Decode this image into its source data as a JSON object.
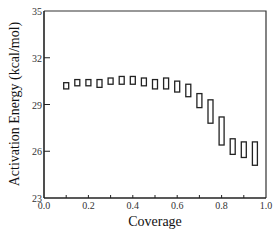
{
  "chart_data": {
    "type": "scatter",
    "marker": "rectangle-range",
    "title": "",
    "xlabel": "Coverage",
    "ylabel": "Activation Energy (kcal/mol)",
    "xlim": [
      0.0,
      1.0
    ],
    "ylim": [
      23,
      35
    ],
    "x_ticks": [
      0.0,
      0.2,
      0.4,
      0.6,
      0.8,
      1.0
    ],
    "x_tick_labels": [
      "0.0",
      "0.2",
      "0.4",
      "0.6",
      "0.8",
      "1.0"
    ],
    "x_minor_step": 0.1,
    "y_ticks": [
      23,
      26,
      29,
      32,
      35
    ],
    "y_tick_labels": [
      "23",
      "26",
      "29",
      "32",
      "35"
    ],
    "grid": false,
    "legend": null,
    "series": [
      {
        "name": "Activation Energy range",
        "points": [
          {
            "x": 0.1,
            "low": 30.0,
            "high": 30.4
          },
          {
            "x": 0.15,
            "low": 30.2,
            "high": 30.6
          },
          {
            "x": 0.2,
            "low": 30.2,
            "high": 30.6
          },
          {
            "x": 0.25,
            "low": 30.1,
            "high": 30.6
          },
          {
            "x": 0.3,
            "low": 30.3,
            "high": 30.7
          },
          {
            "x": 0.35,
            "low": 30.3,
            "high": 30.8
          },
          {
            "x": 0.4,
            "low": 30.3,
            "high": 30.8
          },
          {
            "x": 0.45,
            "low": 30.2,
            "high": 30.7
          },
          {
            "x": 0.5,
            "low": 30.0,
            "high": 30.6
          },
          {
            "x": 0.55,
            "low": 30.0,
            "high": 30.7
          },
          {
            "x": 0.6,
            "low": 29.8,
            "high": 30.5
          },
          {
            "x": 0.65,
            "low": 29.5,
            "high": 30.3
          },
          {
            "x": 0.7,
            "low": 28.8,
            "high": 29.7
          },
          {
            "x": 0.75,
            "low": 27.8,
            "high": 29.3
          },
          {
            "x": 0.8,
            "low": 26.4,
            "high": 28.2
          },
          {
            "x": 0.85,
            "low": 25.8,
            "high": 26.8
          },
          {
            "x": 0.9,
            "low": 25.6,
            "high": 26.6
          },
          {
            "x": 0.95,
            "low": 25.1,
            "high": 26.6
          }
        ]
      }
    ]
  }
}
